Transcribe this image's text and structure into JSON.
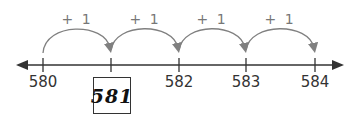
{
  "number_line": {
    "start_value": 580,
    "end_value": 584,
    "step": 1,
    "line_color": "#333333",
    "jump_color": "#808080",
    "ticks": [
      {
        "value": "580",
        "x": 43,
        "boxed": false
      },
      {
        "value": "581",
        "x": 111,
        "boxed": true
      },
      {
        "value": "582",
        "x": 179,
        "boxed": false
      },
      {
        "value": "583",
        "x": 246,
        "boxed": false
      },
      {
        "value": "584",
        "x": 315,
        "boxed": false
      }
    ],
    "jumps": [
      {
        "label": "+ 1",
        "from": "580",
        "to": "581"
      },
      {
        "label": "+ 1",
        "from": "581",
        "to": "582"
      },
      {
        "label": "+ 1",
        "from": "582",
        "to": "583"
      },
      {
        "label": "+ 1",
        "from": "583",
        "to": "584"
      }
    ],
    "answer": "581"
  }
}
